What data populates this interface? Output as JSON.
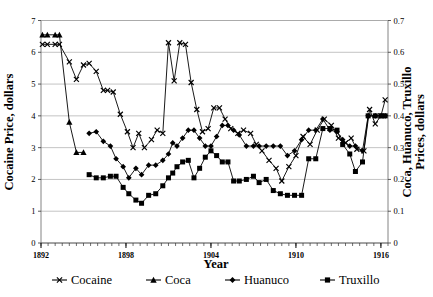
{
  "chart_data": {
    "type": "line",
    "title": "",
    "xlabel": "Year",
    "ylabel": "Cocaine Price, dollars",
    "ylabel_right": "Coca, Huanuco, Truxillo Prices, dollars",
    "xlim": [
      1892,
      1916.5
    ],
    "ylim": [
      0,
      7
    ],
    "ylim_right": [
      0,
      0.7
    ],
    "yticks": [
      0,
      1,
      2,
      3,
      4,
      5,
      6,
      7
    ],
    "ytick_labels": [
      "0",
      "1",
      "2",
      "3",
      "4",
      "5",
      "6",
      "7"
    ],
    "yticks_right": [
      0,
      0.1,
      0.2,
      0.3,
      0.4,
      0.5,
      0.6,
      0.7
    ],
    "ytick_labels_right": [
      "0",
      "0.1",
      "0.2",
      "0.3",
      "0.4",
      "0.5",
      "0.6",
      "0.7"
    ],
    "xticks": [
      1892,
      1898,
      1904,
      1910,
      1916
    ],
    "xtick_labels": [
      "1892",
      "1898",
      "1904",
      "1910",
      "1916"
    ],
    "xtick_minor_step": 0.5,
    "grid": "horizontal",
    "legend_position": "bottom",
    "series": [
      {
        "name": "Cocaine",
        "marker": "x",
        "axis": "left",
        "color": "#000000",
        "points": [
          [
            1892.1,
            6.25
          ],
          [
            1892.45,
            6.25
          ],
          [
            1893.0,
            6.25
          ],
          [
            1893.3,
            6.25
          ],
          [
            1894.0,
            5.7
          ],
          [
            1894.5,
            5.15
          ],
          [
            1895.0,
            5.6
          ],
          [
            1895.4,
            5.65
          ],
          [
            1895.9,
            5.4
          ],
          [
            1896.4,
            4.8
          ],
          [
            1896.7,
            4.8
          ],
          [
            1897.1,
            4.75
          ],
          [
            1897.6,
            4.05
          ],
          [
            1898.1,
            3.5
          ],
          [
            1898.5,
            3.0
          ],
          [
            1898.9,
            3.45
          ],
          [
            1899.3,
            3.0
          ],
          [
            1899.8,
            3.25
          ],
          [
            1900.2,
            3.55
          ],
          [
            1900.6,
            3.45
          ],
          [
            1901.0,
            6.3
          ],
          [
            1901.4,
            5.1
          ],
          [
            1901.8,
            6.3
          ],
          [
            1902.2,
            6.25
          ],
          [
            1902.6,
            5.05
          ],
          [
            1903.0,
            4.2
          ],
          [
            1903.4,
            3.5
          ],
          [
            1903.8,
            3.6
          ],
          [
            1904.2,
            4.25
          ],
          [
            1904.6,
            4.25
          ],
          [
            1905.0,
            3.9
          ],
          [
            1905.4,
            3.6
          ],
          [
            1905.9,
            3.45
          ],
          [
            1906.3,
            3.55
          ],
          [
            1906.8,
            3.45
          ],
          [
            1907.2,
            3.1
          ],
          [
            1907.6,
            2.9
          ],
          [
            1908.1,
            2.6
          ],
          [
            1908.6,
            2.35
          ],
          [
            1909.0,
            1.95
          ],
          [
            1909.5,
            2.4
          ],
          [
            1910.0,
            2.75
          ],
          [
            1910.5,
            3.35
          ],
          [
            1911.0,
            3.1
          ],
          [
            1911.5,
            3.55
          ],
          [
            1912.0,
            3.9
          ],
          [
            1912.5,
            3.7
          ],
          [
            1913.0,
            3.3
          ],
          [
            1913.5,
            3.15
          ],
          [
            1913.9,
            3.3
          ],
          [
            1914.3,
            2.95
          ],
          [
            1914.8,
            2.9
          ],
          [
            1915.2,
            4.2
          ],
          [
            1915.6,
            3.75
          ],
          [
            1916.0,
            4.0
          ],
          [
            1916.3,
            4.5
          ]
        ]
      },
      {
        "name": "Coca",
        "marker": "triangle",
        "axis": "right",
        "color": "#000000",
        "points": [
          [
            1892.1,
            0.655
          ],
          [
            1892.45,
            0.655
          ],
          [
            1893.0,
            0.655
          ],
          [
            1893.3,
            0.655
          ],
          [
            1894.0,
            0.38
          ],
          [
            1894.5,
            0.285
          ],
          [
            1895.0,
            0.285
          ]
        ]
      },
      {
        "name": "Huanuco",
        "marker": "diamond",
        "axis": "right",
        "color": "#000000",
        "points": [
          [
            1895.4,
            0.345
          ],
          [
            1895.9,
            0.35
          ],
          [
            1896.4,
            0.32
          ],
          [
            1896.9,
            0.305
          ],
          [
            1897.3,
            0.265
          ],
          [
            1897.8,
            0.24
          ],
          [
            1898.2,
            0.205
          ],
          [
            1898.7,
            0.235
          ],
          [
            1899.1,
            0.215
          ],
          [
            1899.6,
            0.245
          ],
          [
            1900.1,
            0.245
          ],
          [
            1900.6,
            0.26
          ],
          [
            1901.0,
            0.28
          ],
          [
            1901.3,
            0.315
          ],
          [
            1901.6,
            0.305
          ],
          [
            1902.0,
            0.33
          ],
          [
            1902.4,
            0.355
          ],
          [
            1902.8,
            0.355
          ],
          [
            1903.2,
            0.33
          ],
          [
            1903.6,
            0.305
          ],
          [
            1904.0,
            0.305
          ],
          [
            1904.4,
            0.335
          ],
          [
            1904.8,
            0.37
          ],
          [
            1905.2,
            0.37
          ],
          [
            1905.6,
            0.355
          ],
          [
            1906.0,
            0.34
          ],
          [
            1906.5,
            0.305
          ],
          [
            1907.0,
            0.305
          ],
          [
            1907.4,
            0.305
          ],
          [
            1907.9,
            0.305
          ],
          [
            1908.4,
            0.305
          ],
          [
            1908.9,
            0.305
          ],
          [
            1909.4,
            0.275
          ],
          [
            1909.9,
            0.29
          ],
          [
            1910.4,
            0.325
          ],
          [
            1910.9,
            0.355
          ],
          [
            1911.4,
            0.355
          ],
          [
            1911.9,
            0.39
          ],
          [
            1912.4,
            0.355
          ],
          [
            1912.9,
            0.35
          ],
          [
            1913.3,
            0.325
          ],
          [
            1913.8,
            0.305
          ],
          [
            1914.2,
            0.305
          ],
          [
            1914.7,
            0.29
          ],
          [
            1915.1,
            0.4
          ],
          [
            1915.6,
            0.4
          ],
          [
            1916.0,
            0.4
          ],
          [
            1916.3,
            0.4
          ]
        ]
      },
      {
        "name": "Truxillo",
        "marker": "square",
        "axis": "right",
        "color": "#000000",
        "points": [
          [
            1895.4,
            0.215
          ],
          [
            1895.9,
            0.205
          ],
          [
            1896.4,
            0.205
          ],
          [
            1896.9,
            0.21
          ],
          [
            1897.3,
            0.21
          ],
          [
            1897.8,
            0.175
          ],
          [
            1898.2,
            0.155
          ],
          [
            1898.7,
            0.135
          ],
          [
            1899.1,
            0.125
          ],
          [
            1899.6,
            0.15
          ],
          [
            1900.1,
            0.155
          ],
          [
            1900.6,
            0.18
          ],
          [
            1901.0,
            0.205
          ],
          [
            1901.3,
            0.22
          ],
          [
            1901.6,
            0.24
          ],
          [
            1902.0,
            0.255
          ],
          [
            1902.4,
            0.26
          ],
          [
            1902.8,
            0.205
          ],
          [
            1903.2,
            0.235
          ],
          [
            1903.6,
            0.27
          ],
          [
            1904.0,
            0.29
          ],
          [
            1904.4,
            0.275
          ],
          [
            1904.8,
            0.255
          ],
          [
            1905.2,
            0.255
          ],
          [
            1905.6,
            0.195
          ],
          [
            1906.0,
            0.195
          ],
          [
            1906.5,
            0.2
          ],
          [
            1907.0,
            0.21
          ],
          [
            1907.4,
            0.19
          ],
          [
            1907.9,
            0.2
          ],
          [
            1908.4,
            0.165
          ],
          [
            1908.9,
            0.155
          ],
          [
            1909.4,
            0.15
          ],
          [
            1909.9,
            0.15
          ],
          [
            1910.4,
            0.15
          ],
          [
            1910.9,
            0.265
          ],
          [
            1911.4,
            0.265
          ],
          [
            1911.9,
            0.36
          ],
          [
            1912.4,
            0.36
          ],
          [
            1912.9,
            0.355
          ],
          [
            1913.3,
            0.31
          ],
          [
            1913.8,
            0.28
          ],
          [
            1914.2,
            0.225
          ],
          [
            1914.7,
            0.255
          ],
          [
            1915.1,
            0.4
          ],
          [
            1915.6,
            0.4
          ],
          [
            1916.0,
            0.4
          ],
          [
            1916.3,
            0.4
          ]
        ]
      }
    ],
    "legend": [
      {
        "label": "Cocaine",
        "marker": "x"
      },
      {
        "label": "Coca",
        "marker": "triangle"
      },
      {
        "label": "Huanuco",
        "marker": "diamond"
      },
      {
        "label": "Truxillo",
        "marker": "square"
      }
    ]
  }
}
